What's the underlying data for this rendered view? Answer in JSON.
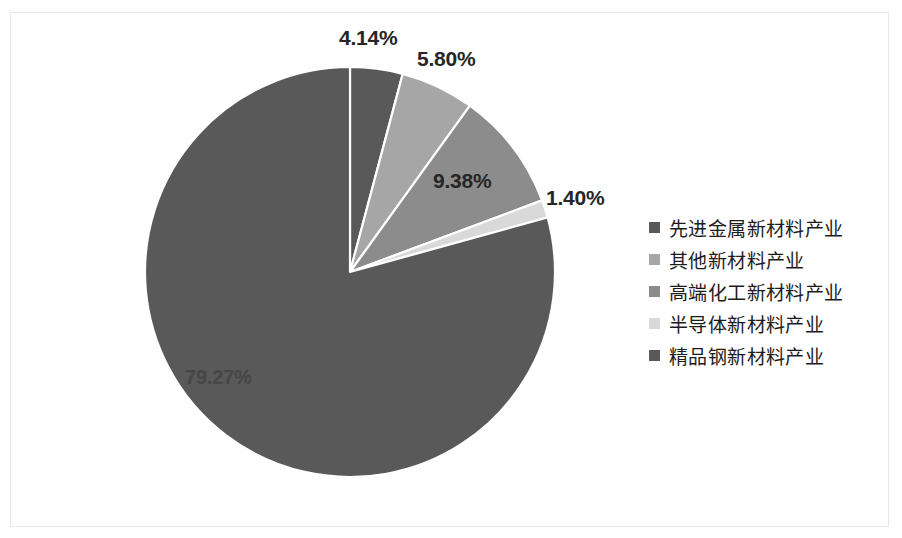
{
  "chart_data": {
    "type": "pie",
    "title": "",
    "categories": [
      "先进金属新材料产业",
      "其他新材料产业",
      "高端化工新材料产业",
      "半导体新材料产业",
      "精品钢新材料产业"
    ],
    "values": [
      4.14,
      5.8,
      9.38,
      1.4,
      79.27
    ],
    "value_labels": [
      "4.14%",
      "5.80%",
      "9.38%",
      "1.40%",
      "79.27%"
    ],
    "colors": [
      "#595959",
      "#a6a6a6",
      "#8c8c8c",
      "#d9d9d9",
      "#595959"
    ],
    "legend_position": "right",
    "grid": false,
    "start_angle_deg": 0,
    "direction": "clockwise",
    "units": "percent"
  },
  "legend": {
    "items": [
      {
        "label": "先进金属新材料产业",
        "color": "#595959",
        "value": "4.14%"
      },
      {
        "label": "其他新材料产业",
        "color": "#a6a6a6",
        "value": "5.80%"
      },
      {
        "label": "高端化工新材料产业",
        "color": "#8c8c8c",
        "value": "9.38%"
      },
      {
        "label": "半导体新材料产业",
        "color": "#d9d9d9",
        "value": "1.40%"
      },
      {
        "label": "精品钢新材料产业",
        "color": "#595959",
        "value": "79.27%"
      }
    ]
  },
  "labels": {
    "l0": "4.14%",
    "l1": "5.80%",
    "l2": "9.38%",
    "l3": "1.40%",
    "l4": "79.27%"
  }
}
